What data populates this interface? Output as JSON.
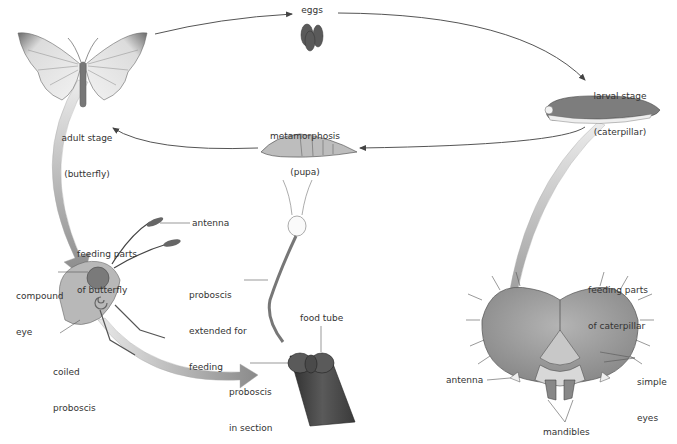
{
  "diagram": {
    "type": "life-cycle",
    "stages": {
      "eggs": "eggs",
      "larval": [
        "larval stage",
        "(caterpillar)"
      ],
      "pupa": [
        "metamorphosis",
        "(pupa)"
      ],
      "adult": [
        "adult stage",
        "(butterfly)"
      ]
    },
    "butterfly_feeding": {
      "title": [
        "feeding parts",
        "of butterfly"
      ],
      "antenna": "antenna",
      "compound_eye": [
        "compound",
        "eye"
      ],
      "coiled_proboscis": [
        "coiled",
        "proboscis"
      ],
      "proboscis_extended": [
        "proboscis",
        "extended for",
        "feeding"
      ],
      "food_tube": "food tube",
      "proboscis_section": [
        "proboscis",
        "in section"
      ]
    },
    "caterpillar_feeding": {
      "title": [
        "feeding parts",
        "of caterpillar"
      ],
      "simple_eyes": [
        "simple",
        "eyes"
      ],
      "antenna": "antenna",
      "mandibles": "mandibles"
    },
    "colors": {
      "text": "#333333",
      "line": "#555555",
      "arrow_gradient_light": "#e6e6e6",
      "arrow_gradient_dark": "#8a8a8a",
      "caterpillar_body": "#7d7d7d",
      "head_capsule": "#9a9a9a",
      "eggs": "#5a5a5a"
    }
  }
}
